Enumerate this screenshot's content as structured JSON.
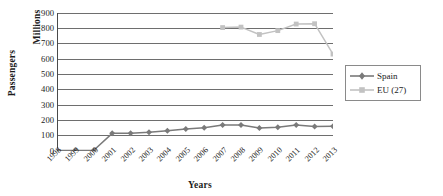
{
  "chart_data": {
    "type": "line",
    "title": "",
    "xlabel": "Years",
    "ylabel": "Passengers  Millions",
    "ylabel_outer": "Passengers",
    "ylabel_inner": "Millions",
    "categories": [
      "1998",
      "1999",
      "2000",
      "2001",
      "2002",
      "2003",
      "2004",
      "2005",
      "2006",
      "2007",
      "2008",
      "2009",
      "2010",
      "2011",
      "2012",
      "2013"
    ],
    "ylim": [
      0,
      900
    ],
    "ytick_values": [
      0,
      100,
      200,
      300,
      400,
      500,
      600,
      700,
      800,
      900
    ],
    "ytick_labels": [
      "0",
      "100",
      "200",
      "300",
      "400",
      "500",
      "600",
      "700",
      "800",
      "900"
    ],
    "grid": true,
    "grid_axis": "y",
    "legend_position": "right",
    "series": [
      {
        "name": "Spain",
        "color": "#7a7a7a",
        "marker": "diamond",
        "values": [
          3,
          4,
          5,
          115,
          116,
          122,
          132,
          143,
          152,
          170,
          169,
          150,
          155,
          169,
          160,
          162
        ]
      },
      {
        "name": "EU (27)",
        "color": "#c2c2c2",
        "marker": "square",
        "values": [
          null,
          null,
          null,
          null,
          null,
          null,
          null,
          null,
          null,
          805,
          808,
          760,
          785,
          828,
          830,
          632
        ]
      }
    ]
  },
  "legend": {
    "items": [
      {
        "label": "Spain"
      },
      {
        "label": "EU (27)"
      }
    ]
  },
  "colors": {
    "spain": "#7a7a7a",
    "eu27": "#c2c2c2",
    "axis": "#4a4a4a",
    "grid": "#5e5e5e",
    "text": "#1b1b1b",
    "legend_border": "#8a8a8a",
    "background": "#ffffff"
  }
}
